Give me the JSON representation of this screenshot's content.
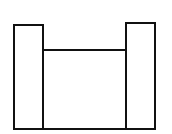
{
  "diagram": {
    "stroke_color": "#111111",
    "background": "#ffffff",
    "shapes": [
      {
        "id": "left-block",
        "x": 14,
        "y": 25,
        "w": 29,
        "h": 104
      },
      {
        "id": "middle-block",
        "x": 43,
        "y": 50,
        "w": 83,
        "h": 79
      },
      {
        "id": "right-block",
        "x": 126,
        "y": 23,
        "w": 29,
        "h": 106
      }
    ]
  }
}
